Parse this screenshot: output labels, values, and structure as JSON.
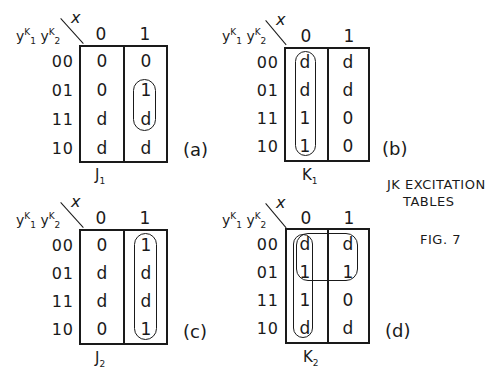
{
  "figure": {
    "caption_line1": "JK EXCITATION",
    "caption_line2": "TABLES",
    "fig_label": "FIG. 7"
  },
  "axis": {
    "row_var_1": "y",
    "row_var_1_sup": "K",
    "row_var_1_sub": "1",
    "row_var_2": "y",
    "row_var_2_sup": "K",
    "row_var_2_sub": "2",
    "col_var": "x",
    "col_labels": [
      "0",
      "1"
    ],
    "row_labels": [
      "00",
      "01",
      "11",
      "10"
    ]
  },
  "maps": [
    {
      "id": "a",
      "tag": "(a)",
      "fn": "J",
      "fn_sub": "1",
      "cells": [
        [
          "0",
          "0"
        ],
        [
          "0",
          "1"
        ],
        [
          "d",
          "d"
        ],
        [
          "d",
          "d"
        ]
      ],
      "loops": [
        "col1 rows 01-11"
      ]
    },
    {
      "id": "b",
      "tag": "(b)",
      "fn": "K",
      "fn_sub": "1",
      "cells": [
        [
          "d",
          "d"
        ],
        [
          "d",
          "d"
        ],
        [
          "1",
          "0"
        ],
        [
          "1",
          "0"
        ]
      ],
      "loops": [
        "col0 rows 00-10"
      ]
    },
    {
      "id": "c",
      "tag": "(c)",
      "fn": "J",
      "fn_sub": "2",
      "cells": [
        [
          "0",
          "1"
        ],
        [
          "d",
          "d"
        ],
        [
          "d",
          "d"
        ],
        [
          "0",
          "1"
        ]
      ],
      "loops": [
        "col1 rows 00-10"
      ]
    },
    {
      "id": "d",
      "tag": "(d)",
      "fn": "K",
      "fn_sub": "2",
      "cells": [
        [
          "d",
          "d"
        ],
        [
          "1",
          "1"
        ],
        [
          "1",
          "0"
        ],
        [
          "d",
          "d"
        ]
      ],
      "loops": [
        "col0 rows 00-10",
        "rows 00-01 cols 0-1"
      ]
    }
  ]
}
